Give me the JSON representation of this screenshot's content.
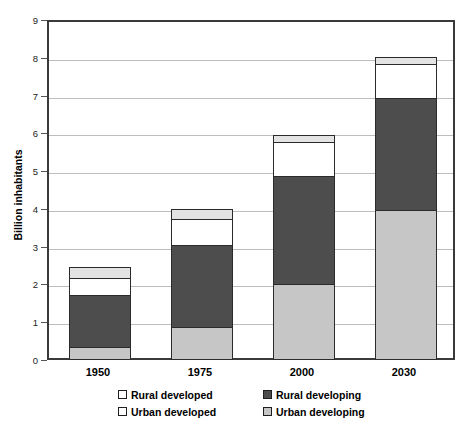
{
  "chart_data": {
    "type": "bar",
    "subtype": "stacked",
    "title": "",
    "xlabel": "",
    "ylabel": "Billion inhabitants",
    "categories": [
      "1950",
      "1975",
      "2000",
      "2030"
    ],
    "ylim": [
      0,
      9
    ],
    "yticks": [
      0,
      1,
      2,
      3,
      4,
      5,
      6,
      7,
      8,
      9
    ],
    "ytick_labels": [
      "0",
      "1",
      "2",
      "3",
      "4",
      "5",
      "6",
      "7",
      "8",
      "9"
    ],
    "grid": true,
    "legend_position": "bottom",
    "stack_order_bottom_to_top": [
      "Urban developing",
      "Rural developing",
      "Urban developed",
      "Rural developed"
    ],
    "series": [
      {
        "name": "Urban developing",
        "color": "#c6c6c6",
        "values": [
          0.32,
          0.85,
          2.0,
          3.95
        ]
      },
      {
        "name": "Rural developing",
        "color": "#4d4d4d",
        "values": [
          1.42,
          2.23,
          2.9,
          3.0
        ]
      },
      {
        "name": "Urban developed",
        "color": "#ffffff",
        "values": [
          0.5,
          0.72,
          0.95,
          0.95
        ]
      },
      {
        "name": "Rural developed",
        "color": "#e3e3e3",
        "values": [
          0.33,
          0.3,
          0.2,
          0.22
        ]
      }
    ],
    "totals": [
      2.57,
      4.1,
      6.05,
      8.12
    ]
  },
  "legend": {
    "entries": [
      {
        "label": "Rural developed",
        "key": "rural-developed"
      },
      {
        "label": "Rural developing",
        "key": "rural-developing"
      },
      {
        "label": "Urban developed",
        "key": "urban-developed"
      },
      {
        "label": "Urban developing",
        "key": "urban-developing"
      }
    ]
  },
  "colors": {
    "urban_developing": "#c6c6c6",
    "rural_developing": "#4d4d4d",
    "urban_developed": "#ffffff",
    "rural_developed": "#e3e3e3",
    "border": "#2b2b2b",
    "gridline": "#bdbdbd",
    "axis": "#3a3a3a"
  }
}
